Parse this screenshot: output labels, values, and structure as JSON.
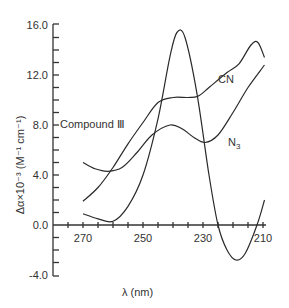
{
  "chart_data": {
    "type": "line",
    "title": "",
    "xlabel": "λ (nm)",
    "ylabel": "Δα×10⁻³ (M⁻¹ cm⁻¹)",
    "xlim": [
      270,
      210
    ],
    "x_reversed": true,
    "ylim": [
      -4.0,
      16.0
    ],
    "x_ticks": [
      "270",
      "250",
      "230",
      "210"
    ],
    "y_ticks": [
      "16.0",
      "12.0",
      "8.0",
      "4.0",
      "0.0",
      "-4.0"
    ],
    "grid": false,
    "legend": "inline labels",
    "series": [
      {
        "name": "Compound III",
        "points": [
          [
            270,
            0.9
          ],
          [
            265,
            0.5
          ],
          [
            260,
            0.3
          ],
          [
            255,
            1.5
          ],
          [
            250,
            4.0
          ],
          [
            245,
            8.5
          ],
          [
            241,
            13.5
          ],
          [
            238.7,
            15.4
          ],
          [
            236,
            15.0
          ],
          [
            232,
            10.5
          ],
          [
            228,
            4.0
          ],
          [
            225,
            0.0
          ],
          [
            222,
            -2.0
          ],
          [
            219,
            -2.8
          ],
          [
            216,
            -2.3
          ],
          [
            212,
            0.0
          ],
          [
            209.5,
            2.0
          ]
        ]
      },
      {
        "name": "CN",
        "points": [
          [
            270,
            1.9
          ],
          [
            265,
            3.0
          ],
          [
            260,
            4.6
          ],
          [
            255,
            6.5
          ],
          [
            250,
            8.2
          ],
          [
            245,
            9.8
          ],
          [
            240,
            10.2
          ],
          [
            235,
            10.2
          ],
          [
            231.7,
            10.3
          ],
          [
            228,
            11.0
          ],
          [
            222,
            12.2
          ],
          [
            218,
            12.9
          ],
          [
            214,
            14.4
          ],
          [
            211.7,
            14.6
          ],
          [
            209.5,
            13.4
          ]
        ]
      },
      {
        "name": "N3",
        "points": [
          [
            270,
            5.0
          ],
          [
            266,
            4.5
          ],
          [
            261.7,
            4.3
          ],
          [
            257,
            4.6
          ],
          [
            252,
            5.8
          ],
          [
            247,
            7.2
          ],
          [
            241,
            8.0
          ],
          [
            237,
            7.7
          ],
          [
            233,
            7.0
          ],
          [
            229.3,
            6.6
          ],
          [
            225,
            7.2
          ],
          [
            220,
            9.0
          ],
          [
            215,
            11.0
          ],
          [
            209.5,
            12.8
          ]
        ]
      }
    ]
  },
  "labels": {
    "compound": "Compound Ⅲ",
    "cn": "CN",
    "n3_main": "N",
    "n3_sub": "3",
    "x_axis_title": "λ   (nm)",
    "y_axis_title": "Δα×10⁻³ (M⁻¹ cm⁻¹)"
  },
  "ticks": {
    "y": [
      "16.0",
      "12.0",
      "8.0",
      "4.0",
      "0.0",
      "-4.0"
    ],
    "x": [
      "270",
      "250",
      "230",
      "210"
    ]
  }
}
